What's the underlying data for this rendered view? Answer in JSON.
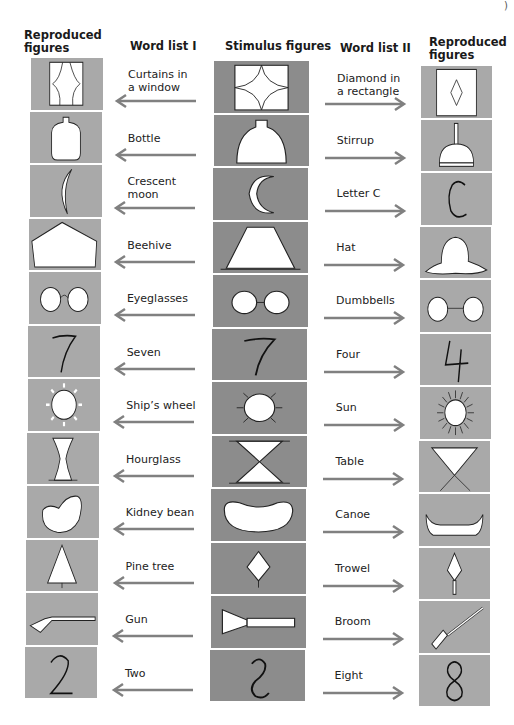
{
  "headers": {
    "left_reproduced": "Reproduced\nfigures",
    "word_list_1": "Word list I",
    "stimulus": "Stimulus figures",
    "word_list_2": "Word list II",
    "right_reproduced": "Reproduced\nfigures"
  },
  "colors": {
    "light_cell": "#a9a9a9",
    "dark_cell": "#8c8c8c",
    "arrow": "#808080"
  },
  "rows": [
    {
      "word1": "Curtains in\na window",
      "stimulus": "concave-square",
      "left_figure": "curtains-window",
      "word2": "Diamond in\na rectangle",
      "right_figure": "diamond-rectangle"
    },
    {
      "word1": "Bottle",
      "stimulus": "bell-jar",
      "left_figure": "bottle",
      "word2": "Stirrup",
      "right_figure": "stirrup"
    },
    {
      "word1": "Crescent\nmoon",
      "stimulus": "crescent",
      "left_figure": "crescent-moon",
      "word2": "Letter C",
      "right_figure": "letter-c"
    },
    {
      "word1": "Beehive",
      "stimulus": "trapezoid",
      "left_figure": "beehive",
      "word2": "Hat",
      "right_figure": "hat"
    },
    {
      "word1": "Eyeglasses",
      "stimulus": "two-circles-line",
      "left_figure": "eyeglasses",
      "word2": "Dumbbells",
      "right_figure": "dumbbells"
    },
    {
      "word1": "Seven",
      "stimulus": "seven",
      "left_figure": "seven",
      "word2": "Four",
      "right_figure": "four"
    },
    {
      "word1": "Ship’s wheel",
      "stimulus": "circle-rays",
      "left_figure": "ships-wheel",
      "word2": "Sun",
      "right_figure": "sun"
    },
    {
      "word1": "Hourglass",
      "stimulus": "two-triangles",
      "left_figure": "hourglass",
      "word2": "Table",
      "right_figure": "table"
    },
    {
      "word1": "Kidney bean",
      "stimulus": "kidney-shape",
      "left_figure": "kidney-bean",
      "word2": "Canoe",
      "right_figure": "canoe"
    },
    {
      "word1": "Pine tree",
      "stimulus": "diamond-stem",
      "left_figure": "pine-tree",
      "word2": "Trowel",
      "right_figure": "trowel"
    },
    {
      "word1": "Gun",
      "stimulus": "triangle-bar",
      "left_figure": "gun",
      "word2": "Broom",
      "right_figure": "broom"
    },
    {
      "word1": "Two",
      "stimulus": "s-curve",
      "left_figure": "two",
      "word2": "Eight",
      "right_figure": "eight"
    }
  ]
}
